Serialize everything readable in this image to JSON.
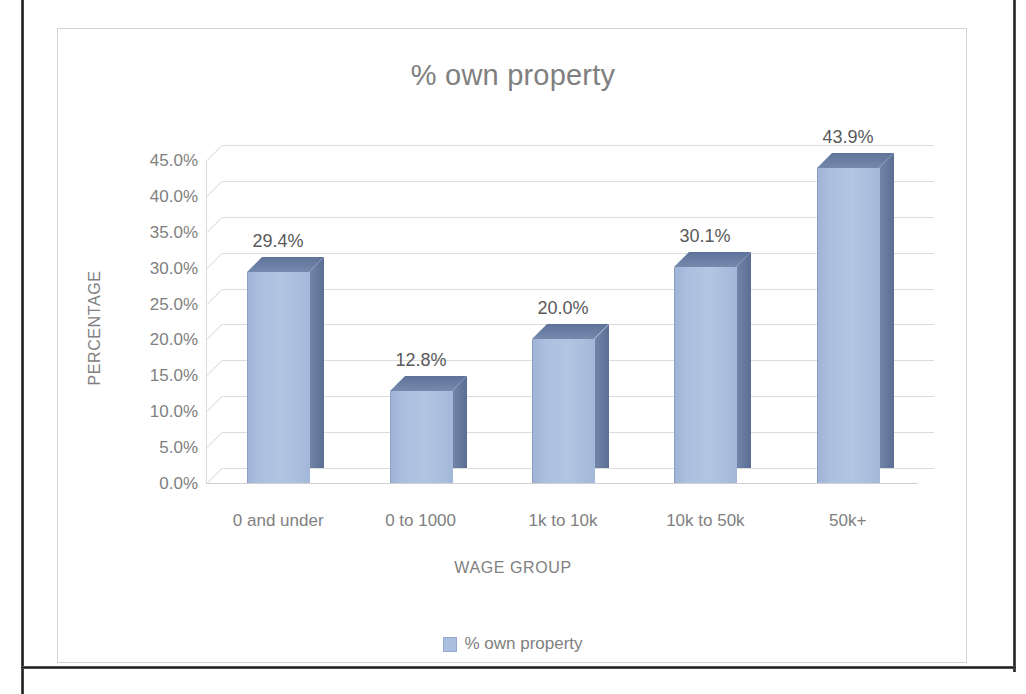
{
  "chart_data": {
    "type": "bar",
    "title": "% own property",
    "xlabel": "WAGE GROUP",
    "ylabel": "PERCENTAGE",
    "categories": [
      "0 and under",
      "0 to 1000",
      "1k to 10k",
      "10k to 50k",
      "50k+"
    ],
    "values": [
      29.4,
      12.8,
      20.0,
      30.1,
      43.9
    ],
    "data_labels": [
      "29.4%",
      "12.8%",
      "20.0%",
      "30.1%",
      "43.9%"
    ],
    "ytick_labels": [
      "45.0%",
      "40.0%",
      "35.0%",
      "30.0%",
      "25.0%",
      "20.0%",
      "15.0%",
      "10.0%",
      "5.0%",
      "0.0%"
    ],
    "ytick_values": [
      45,
      40,
      35,
      30,
      25,
      20,
      15,
      10,
      5,
      0
    ],
    "ylim": [
      0,
      45
    ],
    "grid": true,
    "legend": {
      "position": "bottom",
      "entries": [
        {
          "label": "% own property",
          "color": "#aabfdf"
        }
      ]
    },
    "series": [
      {
        "name": "% own property",
        "values": [
          29.4,
          12.8,
          20.0,
          30.1,
          43.9
        ]
      }
    ],
    "style": {
      "bar_front_color": "#aabfdf",
      "bar_side_color": "#647a9c",
      "bar_top_color": "#6b7fa4",
      "gridline_color": "#dcdcdc",
      "text_color": "#808080",
      "label_color": "#595959",
      "border_color": "#d3d3d3",
      "three_d": true
    }
  }
}
